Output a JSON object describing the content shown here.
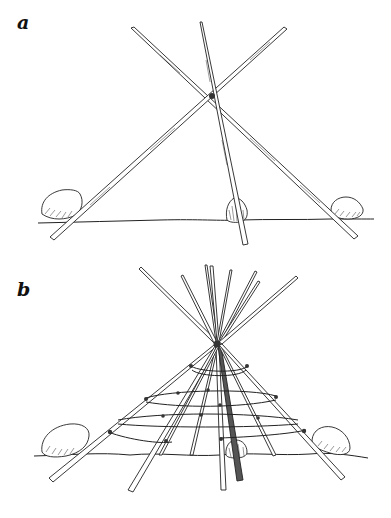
{
  "figure": {
    "panels": [
      {
        "id": "a",
        "label": "a",
        "description": "Three poles tied together at the top, forming a tripod, with the butts braced by stones on the ground",
        "elements": {
          "poles": 3,
          "stones": 3,
          "apex": {
            "x": 212,
            "y": 95
          },
          "ground_y": 222
        }
      },
      {
        "id": "b",
        "label": "b",
        "description": "Conical frame of many poles tied at the apex, with horizontal hoops lashed around the poles and stones at the base",
        "elements": {
          "poles": 10,
          "hoops": 4,
          "stones": 3,
          "apex": {
            "x": 217,
            "y": 343
          },
          "ground_y": 455
        }
      }
    ],
    "colors": {
      "ink": "#1a1a1a",
      "background": "#ffffff"
    }
  }
}
